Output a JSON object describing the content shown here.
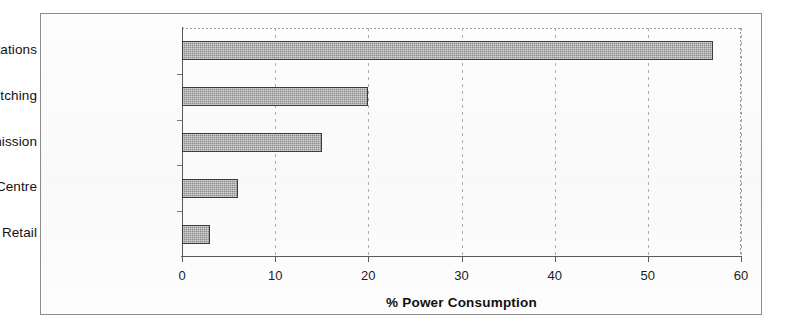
{
  "chart_data": {
    "type": "bar",
    "orientation": "horizontal",
    "title": "",
    "categories": [
      "Base Stations",
      "Mobile Switching",
      "Core Transmission",
      "Data Centre",
      "Retail"
    ],
    "values": [
      57,
      20,
      15,
      6,
      3
    ],
    "xlabel": "% Power Consumption",
    "ylabel": "",
    "xlim": [
      0,
      60
    ],
    "xticks": [
      0,
      10,
      20,
      30,
      40,
      50,
      60
    ],
    "xtick_labels": [
      "0",
      "10",
      "20",
      "30",
      "40",
      "50",
      "60"
    ],
    "grid": "vertical-dashed",
    "legend": "none",
    "series": [
      {
        "name": "% Power Consumption",
        "values": [
          57,
          20,
          15,
          6,
          3
        ]
      }
    ],
    "bar_fill": "#8a8a8a",
    "bar_border": "#3c3c3c",
    "axis_color": "#5a5a5a",
    "gridline_color": "#adadad",
    "frame_color": "#8d8d8d",
    "background": "#fdfdfd"
  }
}
